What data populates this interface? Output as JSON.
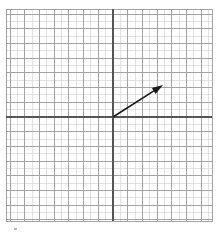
{
  "figure": {
    "title": "",
    "background_color": "#ffffff",
    "width": 220,
    "height": 235
  },
  "grid": {
    "name": "graph-paper-grid",
    "left": 6,
    "top": 9,
    "right": 212,
    "bottom": 221,
    "minor_spacing": 7.35,
    "major_every": 2,
    "minor_color": "#cfcfcf",
    "major_color": "#9a9a9a",
    "minor_width": 0.6,
    "major_width": 0.9,
    "columns": 28,
    "rows": 29,
    "grid_on": true
  },
  "axes": {
    "name": "coordinate-axes",
    "color": "#555555",
    "width": 1.8,
    "origin_x": 113,
    "origin_y": 117,
    "x_axis": {
      "label": "",
      "from_x": 6,
      "to_x": 212,
      "y": 117,
      "ticks": [],
      "tick_labels": []
    },
    "y_axis": {
      "label": "",
      "from_y": 9,
      "to_y": 221,
      "x": 113,
      "ticks": [],
      "tick_labels": []
    }
  },
  "chart_data": {
    "type": "scatter",
    "title": "",
    "xlabel": "",
    "ylabel": "",
    "grid": true,
    "legend": "none",
    "xlim": [
      -14.6,
      13.5
    ],
    "ylim": [
      -14.2,
      14.7
    ],
    "annotations": [
      {
        "kind": "vector-arrow",
        "label": "",
        "tail": [
          0,
          0
        ],
        "head": [
          6.8,
          4.35
        ],
        "tail_px": [
          113,
          117
        ],
        "head_px": [
          163,
          85
        ],
        "color": "#1a1a1a",
        "line_width": 1.6,
        "arrowhead": "solid-triangle",
        "arrowhead_length_px": 11,
        "arrowhead_width_px": 7
      }
    ],
    "series": [
      {
        "name": "vector",
        "x": [
          0,
          6.8
        ],
        "y": [
          0,
          4.35
        ]
      }
    ]
  },
  "marks": {
    "corner_artifact": {
      "name": "bottom-left-artifact",
      "x": 14,
      "y": 228,
      "width": 3,
      "height": 2,
      "color": "#b8b8b8"
    }
  }
}
